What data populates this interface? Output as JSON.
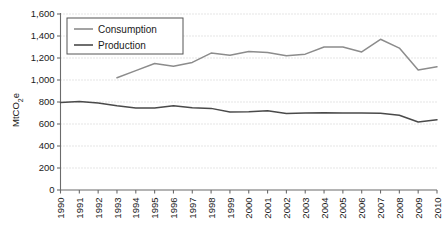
{
  "chart_data": {
    "type": "line",
    "title": "",
    "xlabel": "",
    "ylabel": "MtCO2e",
    "ylabel_display": "MtCO₂e",
    "ylim": [
      0,
      1600
    ],
    "ytick_step": 200,
    "grid": true,
    "legend_position": "top-left",
    "categories": [
      "1990",
      "1991",
      "1992",
      "1993",
      "1994",
      "1995",
      "1996",
      "1997",
      "1998",
      "1999",
      "2000",
      "2001",
      "2002",
      "2003",
      "2004",
      "2005",
      "2006",
      "2007",
      "2008",
      "2009",
      "2010"
    ],
    "ytick_labels": [
      "0",
      "200",
      "400",
      "600",
      "800",
      "1,000",
      "1,200",
      "1,400",
      "1,600"
    ],
    "ytick_values": [
      0,
      200,
      400,
      600,
      800,
      1000,
      1200,
      1400,
      1600
    ],
    "series": [
      {
        "name": "Consumption",
        "color": "#8c8c8c",
        "x": [
          "1993",
          "1994",
          "1995",
          "1996",
          "1997",
          "1998",
          "1999",
          "2000",
          "2001",
          "2002",
          "2003",
          "2004",
          "2005",
          "2006",
          "2007",
          "2008",
          "2009",
          "2010"
        ],
        "values": [
          1020,
          1085,
          1150,
          1125,
          1160,
          1245,
          1225,
          1260,
          1250,
          1220,
          1235,
          1300,
          1300,
          1255,
          1370,
          1290,
          1090,
          1120
        ]
      },
      {
        "name": "Production",
        "color": "#4a4a4a",
        "x": [
          "1990",
          "1991",
          "1992",
          "1993",
          "1994",
          "1995",
          "1996",
          "1997",
          "1998",
          "1999",
          "2000",
          "2001",
          "2002",
          "2003",
          "2004",
          "2005",
          "2006",
          "2007",
          "2008",
          "2009",
          "2010"
        ],
        "values": [
          795,
          805,
          790,
          765,
          745,
          745,
          765,
          748,
          742,
          710,
          712,
          720,
          695,
          700,
          702,
          700,
          700,
          698,
          680,
          618,
          638
        ]
      }
    ]
  },
  "legend": {
    "items": [
      {
        "label": "Consumption",
        "color": "#8c8c8c"
      },
      {
        "label": "Production",
        "color": "#4a4a4a"
      }
    ]
  },
  "axes": {
    "y_axis_title": "MtCO₂e",
    "y_axis_title_base": "MtCO",
    "y_axis_title_sub": "2",
    "y_axis_title_tail": "e"
  }
}
